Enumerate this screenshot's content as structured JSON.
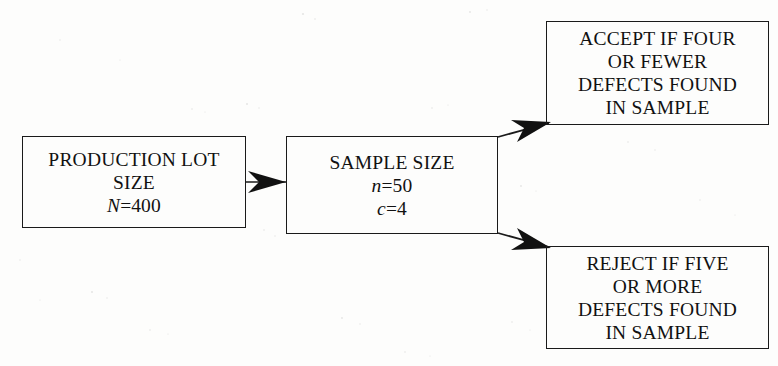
{
  "diagram": {
    "background_color": "#fdfdfc",
    "line_color": "#1a1a1a",
    "text_color": "#111111",
    "nodes": [
      {
        "id": "lot",
        "name": "production-lot-box",
        "lines": [
          "PRODUCTION LOT",
          "SIZE"
        ],
        "variables": [
          {
            "symbol": "N",
            "operator": "=",
            "value": "400"
          }
        ]
      },
      {
        "id": "sample",
        "name": "sample-size-box",
        "lines": [
          "SAMPLE SIZE"
        ],
        "variables": [
          {
            "symbol": "n",
            "operator": "=",
            "value": "50"
          },
          {
            "symbol": "c",
            "operator": "=",
            "value": "4"
          }
        ]
      },
      {
        "id": "accept",
        "name": "accept-outcome-box",
        "lines": [
          "ACCEPT IF FOUR",
          "OR FEWER",
          "DEFECTS FOUND",
          "IN SAMPLE"
        ],
        "variables": []
      },
      {
        "id": "reject",
        "name": "reject-outcome-box",
        "lines": [
          "REJECT IF FIVE",
          "OR MORE",
          "DEFECTS FOUND",
          "IN SAMPLE"
        ],
        "variables": []
      }
    ],
    "edges": [
      {
        "id": "lot-to-sample",
        "from": "lot",
        "to": "sample",
        "style": "straight-arrow"
      },
      {
        "id": "sample-to-accept",
        "from": "sample",
        "to": "accept",
        "style": "diagonal-arrow-up"
      },
      {
        "id": "sample-to-reject",
        "from": "sample",
        "to": "reject",
        "style": "diagonal-arrow-down"
      }
    ]
  }
}
